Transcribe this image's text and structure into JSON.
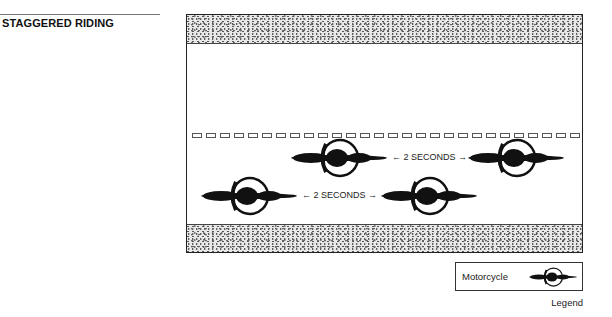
{
  "header": {
    "title": "STAGGERED RIDING"
  },
  "diagram": {
    "lane_dashes": 44,
    "gaps": [
      {
        "label": "← 2 SECONDS →"
      },
      {
        "label": "← 2 SECONDS →"
      }
    ],
    "motorcycles": [
      {
        "row": 1,
        "x": 289,
        "y": 158
      },
      {
        "row": 1,
        "x": 466,
        "y": 158
      },
      {
        "row": 2,
        "x": 199,
        "y": 196
      },
      {
        "row": 2,
        "x": 379,
        "y": 196
      }
    ]
  },
  "legend": {
    "item_label": "Motorcycle",
    "item_icon": "motorcycle-icon",
    "caption": "Legend"
  }
}
